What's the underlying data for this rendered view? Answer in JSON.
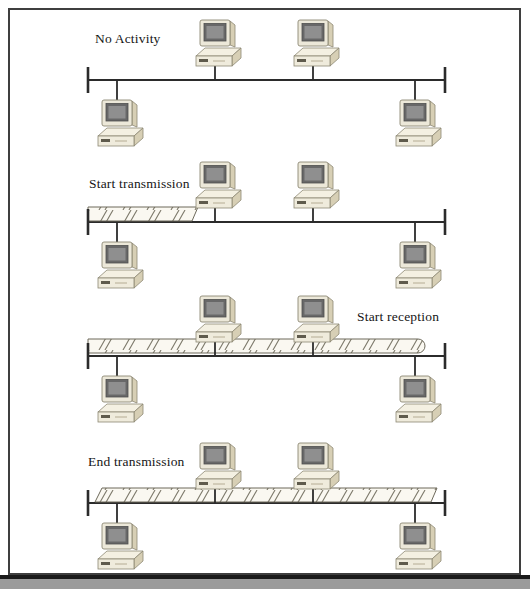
{
  "figure": {
    "stations_per_bus": 4,
    "stations_above_bus": 2,
    "stations_below_bus": 2
  },
  "panels": [
    {
      "id": "no-activity",
      "label": "No Activity",
      "label_position": "top-left",
      "signal_bar": {
        "visible": false
      }
    },
    {
      "id": "start-transmission",
      "label": "Start transmission",
      "label_position": "top-left",
      "signal_bar": {
        "visible": true,
        "extent": "left terminator to about one third of bus",
        "right_end": "slanted"
      }
    },
    {
      "id": "start-reception",
      "label": "Start reception",
      "label_position": "top-right",
      "signal_bar": {
        "visible": true,
        "extent": "left terminator to rightmost station",
        "right_end": "rounded"
      }
    },
    {
      "id": "end-transmission",
      "label": "End transmission",
      "label_position": "top-left",
      "signal_bar": {
        "visible": true,
        "extent": "just after left terminator to right terminator",
        "ends": "slanted"
      }
    }
  ],
  "icons": {
    "station": "desktop-pc-icon"
  },
  "colors": {
    "background": "#ffffff",
    "line": "#2b2b2b",
    "frame_border": "#3f3f3f",
    "computer_body": "#ece8d9",
    "computer_shadow": "#d7cfb5",
    "computer_screen": "#686868",
    "signal_fill": "#faf8f1",
    "signal_hatch": "#7c786a",
    "bottom_bar": "#9b9b9b",
    "bottom_bar_line": "#1a1a1a"
  }
}
